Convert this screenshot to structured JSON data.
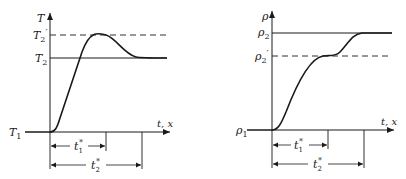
{
  "panels": [
    {
      "id": "temperature",
      "y_axis_label": "T",
      "x_axis_label": "t, x",
      "initial_label": "T",
      "initial_sub": "1",
      "final_label": "T",
      "final_sub": "2",
      "overshoot_label": "T",
      "overshoot_sub": "2",
      "overshoot_prime": "′",
      "interval1_label": "t",
      "interval1_sub": "1",
      "interval1_sup": "*",
      "interval2_label": "t",
      "interval2_sub": "2",
      "interval2_sup": "*",
      "description": "Temperature rises from T1, overshoots to T2' at t1*, then relaxes to T2 by t2*"
    },
    {
      "id": "density",
      "y_axis_label": "ρ",
      "x_axis_label": "t, x",
      "initial_label": "ρ",
      "initial_sub": "1",
      "final_label": "ρ",
      "final_sub": "2",
      "intermediate_label": "ρ",
      "intermediate_sub": "2",
      "intermediate_prime": "′",
      "interval1_label": "t",
      "interval1_sub": "1",
      "interval1_sup": "*",
      "interval2_label": "t",
      "interval2_sub": "2",
      "interval2_sup": "*",
      "description": "Density rises from ρ1 to plateau ρ2' at t1*, then rises to ρ2 by t2*"
    }
  ],
  "colors": {
    "stroke": "#1a1a1a",
    "background": "#ffffff"
  }
}
